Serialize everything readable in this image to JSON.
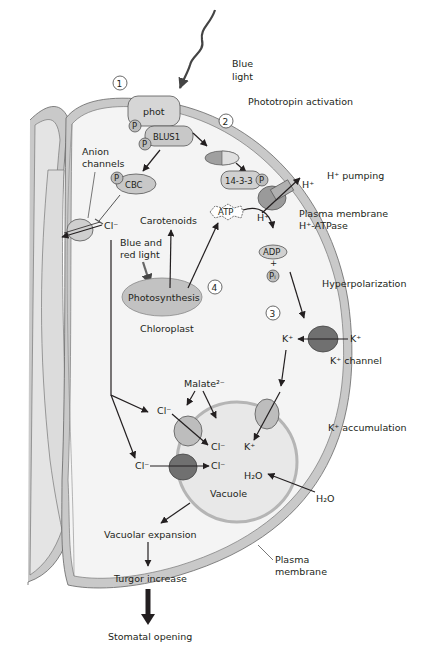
{
  "colors": {
    "membrane": "#c9c9c9",
    "cytoplasm": "#f4f4f4",
    "vacuole": "#e8e8e8",
    "protein_light": "#bdbdbd",
    "protein_dark": "#707070",
    "chloroplast": "#c2c2c2",
    "ink": "#231f20"
  },
  "steps": [
    "1",
    "2",
    "3",
    "4"
  ],
  "labels": {
    "blue_light": [
      "Blue",
      "light"
    ],
    "phot": "phot",
    "blus1": "BLUS1",
    "phospho": "P",
    "cbc": "CBC",
    "anion_channels": [
      "Anion",
      "channels"
    ],
    "cl": "Cl⁻",
    "phototropin_activation": "Phototropin activation",
    "h_pumping": "H⁺ pumping",
    "h_plus": "H⁺",
    "protein_1433": "14-3-3",
    "atp": "ATP",
    "plasma_membrane_atpase": [
      "Plasma membrane",
      "H⁺-ATPase"
    ],
    "adp": "ADP",
    "plus": "+",
    "pi": "Pᵢ",
    "carotenoids": "Carotenoids",
    "blue_red_light": [
      "Blue and",
      "red light"
    ],
    "photosynthesis": "Photosynthesis",
    "chloroplast": "Chloroplast",
    "hyperpolarization": "Hyperpolarization",
    "k_plus": "K⁺",
    "k_channel": "K⁺ channel",
    "malate": "Malate²⁻",
    "k_accumulation": "K⁺ accumulation",
    "h2o": "H₂O",
    "vacuole": "Vacuole",
    "vacuolar_expansion": "Vacuolar expansion",
    "turgor_increase": "Turgor increase",
    "plasma_membrane": [
      "Plasma",
      "membrane"
    ],
    "stomatal_opening": "Stomatal opening"
  }
}
